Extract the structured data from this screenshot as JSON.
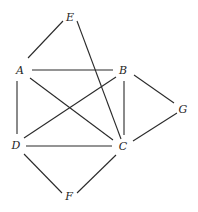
{
  "diagram": {
    "type": "undirected-graph",
    "nodes": [
      {
        "id": "E",
        "label": "E",
        "x": 70,
        "y": 17
      },
      {
        "id": "A",
        "label": "A",
        "x": 20,
        "y": 70
      },
      {
        "id": "B",
        "label": "B",
        "x": 123,
        "y": 70
      },
      {
        "id": "G",
        "label": "G",
        "x": 183,
        "y": 109
      },
      {
        "id": "D",
        "label": "D",
        "x": 16,
        "y": 145
      },
      {
        "id": "C",
        "label": "C",
        "x": 123,
        "y": 146
      },
      {
        "id": "F",
        "label": "F",
        "x": 69,
        "y": 196
      }
    ],
    "edges": [
      {
        "from": "E",
        "to": "A",
        "x1": 63,
        "y1": 21,
        "x2": 28,
        "y2": 58
      },
      {
        "from": "E",
        "to": "C",
        "x1": 77,
        "y1": 21,
        "x2": 121,
        "y2": 139
      },
      {
        "from": "A",
        "to": "B",
        "x1": 32,
        "y1": 70,
        "x2": 113,
        "y2": 70
      },
      {
        "from": "A",
        "to": "D",
        "x1": 17,
        "y1": 81,
        "x2": 17,
        "y2": 134
      },
      {
        "from": "A",
        "to": "C",
        "x1": 30,
        "y1": 78,
        "x2": 113,
        "y2": 140
      },
      {
        "from": "B",
        "to": "D",
        "x1": 116,
        "y1": 77,
        "x2": 24,
        "y2": 138
      },
      {
        "from": "B",
        "to": "C",
        "x1": 124,
        "y1": 81,
        "x2": 124,
        "y2": 135
      },
      {
        "from": "B",
        "to": "G",
        "x1": 134,
        "y1": 75,
        "x2": 174,
        "y2": 103
      },
      {
        "from": "G",
        "to": "C",
        "x1": 177,
        "y1": 113,
        "x2": 133,
        "y2": 141
      },
      {
        "from": "D",
        "to": "C",
        "x1": 26,
        "y1": 146,
        "x2": 112,
        "y2": 146
      },
      {
        "from": "D",
        "to": "F",
        "x1": 24,
        "y1": 154,
        "x2": 62,
        "y2": 193
      },
      {
        "from": "F",
        "to": "C",
        "x1": 77,
        "y1": 193,
        "x2": 116,
        "y2": 155
      }
    ]
  }
}
